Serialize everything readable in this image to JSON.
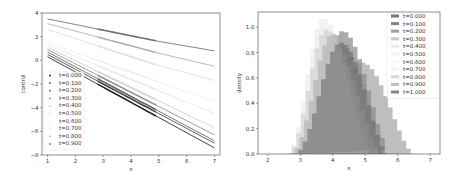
{
  "chart_data": [
    {
      "type": "line",
      "title": "",
      "xlabel": "x",
      "ylabel": "control",
      "xlim": [
        0.8,
        7.2
      ],
      "ylim": [
        -8,
        4
      ],
      "xticks": [
        1,
        2,
        3,
        4,
        5,
        6,
        7
      ],
      "yticks": [
        -8,
        -6,
        -4,
        -2,
        0,
        2,
        4
      ],
      "grid": false,
      "legend_position": "lower left",
      "series": [
        {
          "name": "t=0.000",
          "color": "#111111",
          "x": [
            1,
            7
          ],
          "y": [
            0.3,
            -7.4
          ]
        },
        {
          "name": "t=0.100",
          "color": "#333333",
          "x": [
            1,
            7
          ],
          "y": [
            0.5,
            -7.0
          ]
        },
        {
          "name": "t=0.200",
          "color": "#555555",
          "x": [
            1,
            7
          ],
          "y": [
            0.7,
            -6.8
          ]
        },
        {
          "name": "t=0.300",
          "color": "#888888",
          "x": [
            1,
            7
          ],
          "y": [
            0.9,
            -6.3
          ]
        },
        {
          "name": "t=0.400",
          "color": "#cccccc",
          "x": [
            1,
            7
          ],
          "y": [
            1.1,
            -5.7
          ]
        },
        {
          "name": "t=0.500",
          "color": "#e6e6e6",
          "x": [
            1,
            7
          ],
          "y": [
            1.3,
            -4.5
          ]
        },
        {
          "name": "t=0.600",
          "color": "#eeeeee",
          "x": [
            1,
            7
          ],
          "y": [
            1.5,
            -3.5
          ]
        },
        {
          "name": "t=0.700",
          "color": "#dddddd",
          "x": [
            1,
            4.8,
            7
          ],
          "y": [
            2.6,
            -0.3,
            -1.7
          ]
        },
        {
          "name": "t=0.800",
          "color": "#aaaaaa",
          "x": [
            1,
            5,
            7
          ],
          "y": [
            3.1,
            0.6,
            -0.5
          ]
        },
        {
          "name": "t=0.900",
          "color": "#666666",
          "x": [
            1,
            5,
            7
          ],
          "y": [
            3.5,
            1.6,
            0.8
          ]
        }
      ]
    },
    {
      "type": "bar",
      "subtype": "histogram",
      "title": "",
      "xlabel": "x",
      "ylabel": "density",
      "xlim": [
        1.7,
        7.3
      ],
      "ylim": [
        0,
        1.12
      ],
      "xticks": [
        2,
        3,
        4,
        5,
        6,
        7
      ],
      "yticks": [
        0.0,
        0.2,
        0.4,
        0.6,
        0.8,
        1.0
      ],
      "grid": false,
      "legend_position": "upper right",
      "series": [
        {
          "name": "t=0.000",
          "color": "#555555",
          "peak_x": 4.25,
          "peak_density": 0.87,
          "range": [
            2.7,
            5.6
          ]
        },
        {
          "name": "t=0.100",
          "color": "#666666",
          "peak_x": 4.3,
          "peak_density": 0.97,
          "range": [
            2.8,
            5.8
          ]
        },
        {
          "name": "t=0.200",
          "color": "#888888",
          "peak_x": 4.9,
          "peak_density": 0.72,
          "range": [
            2.9,
            6.5
          ]
        },
        {
          "name": "t=0.300",
          "color": "#bbbbbb",
          "peak_x": 3.8,
          "peak_density": 0.98,
          "range": [
            2.6,
            5.5
          ]
        },
        {
          "name": "t=0.400",
          "color": "#e6e6e6",
          "peak_x": 3.7,
          "peak_density": 1.07,
          "range": [
            2.6,
            5.2
          ]
        },
        {
          "name": "t=0.500",
          "color": "#f2f2f2",
          "peak_x": 3.7,
          "peak_density": 1.05,
          "range": [
            2.6,
            5.2
          ]
        },
        {
          "name": "t=0.600",
          "color": "#f5f5f5",
          "peak_x": 3.7,
          "peak_density": 1.03,
          "range": [
            2.6,
            5.2
          ]
        },
        {
          "name": "t=0.700",
          "color": "#eeeeee",
          "peak_x": 3.7,
          "peak_density": 1.0,
          "range": [
            2.6,
            5.3
          ]
        },
        {
          "name": "t=0.800",
          "color": "#cccccc",
          "peak_x": 3.8,
          "peak_density": 0.98,
          "range": [
            2.6,
            5.5
          ]
        },
        {
          "name": "t=0.900",
          "color": "#aaaaaa",
          "peak_x": 4.0,
          "peak_density": 0.95,
          "range": [
            2.7,
            5.7
          ]
        },
        {
          "name": "t=1.000",
          "color": "#666666",
          "peak_x": 4.25,
          "peak_density": 0.88,
          "range": [
            2.8,
            5.7
          ]
        }
      ]
    }
  ]
}
